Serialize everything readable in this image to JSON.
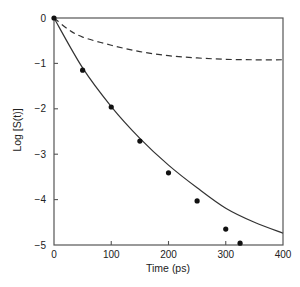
{
  "chart_data": {
    "type": "line",
    "title": "",
    "xlabel": "Time (ps)",
    "ylabel": "Log [S(t)]",
    "xlim": [
      0,
      400
    ],
    "ylim": [
      -5,
      0
    ],
    "grid": false,
    "legend": null,
    "x_ticks": [
      0,
      100,
      200,
      300,
      400
    ],
    "x_tick_labels": [
      "0",
      "100",
      "200",
      "300",
      "400"
    ],
    "y_ticks": [
      0,
      -1,
      -2,
      -3,
      -4,
      -5
    ],
    "y_tick_labels": [
      "0",
      "−1",
      "−2",
      "−3",
      "−4",
      "−5"
    ],
    "series": [
      {
        "name": "solid-curve",
        "style": "solid",
        "color": "#333333",
        "x": [
          0,
          50,
          100,
          150,
          200,
          250,
          300,
          350,
          400
        ],
        "y": [
          0,
          -1.1,
          -1.95,
          -2.65,
          -3.24,
          -3.74,
          -4.19,
          -4.5,
          -4.74
        ]
      },
      {
        "name": "dashed-curve",
        "style": "dashed",
        "color": "#333333",
        "x": [
          0,
          25,
          50,
          100,
          150,
          200,
          250,
          300,
          350,
          400
        ],
        "y": [
          0,
          -0.25,
          -0.42,
          -0.6,
          -0.74,
          -0.83,
          -0.88,
          -0.91,
          -0.92,
          -0.92
        ]
      },
      {
        "name": "data-points",
        "style": "markers",
        "color": "#111111",
        "x": [
          0,
          50,
          100,
          150,
          200,
          250,
          300,
          325
        ],
        "y": [
          0,
          -1.15,
          -1.96,
          -2.71,
          -3.41,
          -4.03,
          -4.65,
          -4.96
        ]
      }
    ]
  }
}
